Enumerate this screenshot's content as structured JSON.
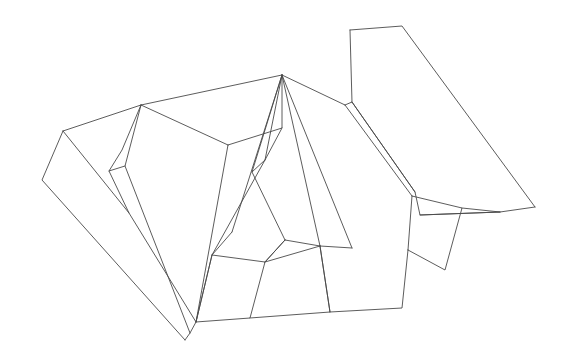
{
  "figure": {
    "type": "line-art-wireframe",
    "width": 567,
    "height": 363,
    "background_color": "#ffffff",
    "stroke_color": "#4a4a4a",
    "stroke_width": 0.9,
    "face_fill": "#ffffff"
  },
  "geometry": {
    "faces": [
      {
        "name": "left-outer-flap",
        "points": "63,131 42,180 185,340 190,333 196,322 129,213"
      },
      {
        "name": "left-ridge-panel",
        "points": "63,131 141,105 125,166 190,333 185,340 196,322 129,213"
      },
      {
        "name": "left-sliver-triangle",
        "points": "141,105 125,166 109,171 122,150"
      },
      {
        "name": "left-upper-wedge",
        "points": "63,131 141,105 122,150 109,171 129,213"
      },
      {
        "name": "second-ridge-panel",
        "points": "141,105 228,145 196,322 190,333 125,166"
      },
      {
        "name": "top-trapezoid",
        "points": "141,105 282,75 282,128 228,145"
      },
      {
        "name": "center-left-valley",
        "points": "228,145 282,128 265,160 212,255 196,322"
      },
      {
        "name": "center-fan-a",
        "points": "282,75 282,128 265,160 212,255 232,232"
      },
      {
        "name": "center-fan-b",
        "points": "282,75 265,160 252,172 285,240 320,246"
      },
      {
        "name": "center-fan-c",
        "points": "282,75 320,246 352,248 345,105"
      },
      {
        "name": "right-fan-panel",
        "points": "282,75 345,105 412,196 408,250 352,248"
      },
      {
        "name": "right-upper-panel",
        "points": "345,105 352,102 415,192 412,196"
      },
      {
        "name": "big-right-flap",
        "points": "350,30 402,26 535,207 500,212 420,215"
      },
      {
        "name": "big-right-flap-under",
        "points": "350,30 352,102 415,192 420,215 500,212 535,207"
      },
      {
        "name": "right-tab-quad",
        "points": "412,196 462,208 445,270 408,250"
      },
      {
        "name": "bottom-tab-left",
        "points": "196,322 212,255 265,262 250,318"
      },
      {
        "name": "bottom-tab-mid",
        "points": "250,318 265,262 285,240 320,246 330,312"
      },
      {
        "name": "bottom-tab-right",
        "points": "330,312 320,246 352,248 408,250 402,308"
      }
    ],
    "edges": [
      "M63,131 L42,180 L185,340",
      "M185,340 L190,333 L196,322 L129,213 L63,131",
      "M63,131 L141,105",
      "M141,105 L122,150 L109,171 L129,213",
      "M141,105 L125,166 L190,333",
      "M125,166 L109,171",
      "M141,105 L228,145",
      "M228,145 L196,322",
      "M141,105 L282,75",
      "M282,75 L282,128 L228,145",
      "M282,128 L265,160 L212,255 L196,322",
      "M282,75 L232,232",
      "M282,75 L265,160",
      "M282,75 L252,172 L285,240",
      "M282,75 L320,246",
      "M282,75 L352,248",
      "M282,75 L345,105",
      "M345,105 L412,196",
      "M345,105 L352,102 L415,192",
      "M412,196 L408,250",
      "M350,30 L402,26 L535,207",
      "M350,30 L352,102",
      "M352,102 L415,192 L420,215 L500,212 L535,207",
      "M420,215 L500,212",
      "M412,196 L462,208 L445,270 L408,250",
      "M462,208 L500,212",
      "M196,322 L212,255",
      "M212,255 L265,262 L250,318 L196,322",
      "M265,262 L285,240",
      "M265,262 L320,246",
      "M250,318 L330,312 L320,246",
      "M330,312 L402,308 L408,250",
      "M320,246 L352,248",
      "M232,232 L212,255",
      "M252,172 L265,160",
      "M285,240 L320,246",
      "M285,240 L265,262",
      "M330,312 L320,246"
    ]
  }
}
